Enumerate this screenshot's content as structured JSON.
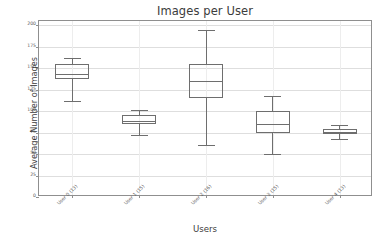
{
  "chart_data": {
    "type": "box",
    "title": "Images per User",
    "xlabel": "Users",
    "ylabel": "Average Number of Images",
    "ylim": [
      0,
      205
    ],
    "grid": true,
    "legend": null,
    "categories": [
      "User 0 (13)",
      "User 1 (15)",
      "User 2 (16)",
      "User 3 (15)",
      "User 4 (13)"
    ],
    "yticks": [
      0,
      25,
      50,
      75,
      100,
      125,
      150,
      175,
      200
    ],
    "ytick_labels": [
      "0",
      "25",
      "50",
      "75",
      "100",
      "125",
      "150",
      "175",
      "200"
    ],
    "boxes": [
      {
        "category": "User 0 (13)",
        "whisker_low": 112,
        "q1": 138,
        "median": 143,
        "q3": 155,
        "whisker_high": 162
      },
      {
        "category": "User 1 (15)",
        "whisker_low": 72,
        "q1": 85,
        "median": 89,
        "q3": 95,
        "whisker_high": 101
      },
      {
        "category": "User 2 (16)",
        "whisker_low": 60,
        "q1": 115,
        "median": 135,
        "q3": 155,
        "whisker_high": 195
      },
      {
        "category": "User 3 (15)",
        "whisker_low": 50,
        "q1": 74,
        "median": 85,
        "q3": 100,
        "whisker_high": 118
      },
      {
        "category": "User 4 (13)",
        "whisker_low": 68,
        "q1": 73,
        "median": 76,
        "q3": 79,
        "whisker_high": 84
      }
    ]
  },
  "colors": {
    "axis": "#8f8f8f",
    "grid": "#dedede",
    "box_line": "#6e6e6e",
    "text": "#3c3c3c",
    "background": "#ffffff"
  }
}
